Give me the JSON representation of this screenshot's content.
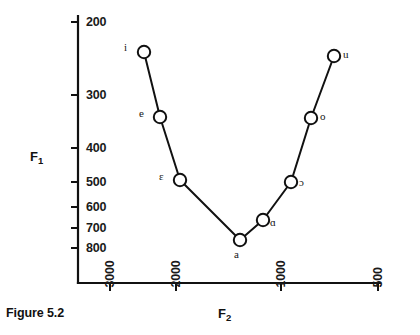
{
  "caption": "Figure 5.2",
  "axes": {
    "y_name": "F",
    "y_name_sub": "1",
    "x_name": "F",
    "x_name_sub": "2",
    "y_ticks": [
      {
        "label": "200",
        "value": 200,
        "y": 22
      },
      {
        "label": "300",
        "value": 300,
        "y": 95
      },
      {
        "label": "400",
        "value": 400,
        "y": 148
      },
      {
        "label": "500",
        "value": 500,
        "y": 182
      },
      {
        "label": "600",
        "value": 600,
        "y": 207
      },
      {
        "label": "700",
        "value": 700,
        "y": 228
      },
      {
        "label": "800",
        "value": 800,
        "y": 248
      }
    ],
    "x_ticks": [
      {
        "label": "3000",
        "value": 3000,
        "x": 110
      },
      {
        "label": "2000",
        "value": 2000,
        "x": 176
      },
      {
        "label": "1000",
        "value": 1000,
        "x": 281
      },
      {
        "label": "500",
        "value": 500,
        "x": 378
      }
    ]
  },
  "chart_data": {
    "type": "line",
    "title": "Figure 5.2",
    "xlabel": "F2",
    "ylabel": "F1",
    "xlim": [
      3400,
      450
    ],
    "ylim": [
      820,
      180
    ],
    "x_axis_reversed": true,
    "y_axis_reversed": true,
    "grid": false,
    "legend": "none",
    "x_tick_labels": [
      "3000",
      "2000",
      "1000",
      "500"
    ],
    "y_tick_labels": [
      "200",
      "300",
      "400",
      "500",
      "600",
      "700",
      "800"
    ],
    "series": [
      {
        "name": "cardinal vowels",
        "point_labels": [
          "i",
          "e",
          "ɛ",
          "a",
          "ɑ",
          "ɔ",
          "o",
          "u"
        ],
        "points": [
          {
            "label": "i",
            "F2": 2350,
            "F1": 245,
            "px": 144,
            "py": 52,
            "label_dx": -17,
            "label_dy": -5
          },
          {
            "label": "e",
            "F2": 2150,
            "F1": 350,
            "px": 160,
            "py": 117,
            "label_dx": -18,
            "label_dy": -4
          },
          {
            "label": "ɛ",
            "F2": 1900,
            "F1": 500,
            "px": 180,
            "py": 180,
            "label_dx": -18,
            "label_dy": -4
          },
          {
            "label": "a",
            "F2": 1300,
            "F1": 715,
            "px": 240,
            "py": 240,
            "label_dx": -3,
            "label_dy": 14
          },
          {
            "label": "ɑ",
            "F2": 1150,
            "F1": 660,
            "px": 263,
            "py": 220,
            "label_dx": 10,
            "label_dy": 2
          },
          {
            "label": "ɔ",
            "F2": 1000,
            "F1": 500,
            "px": 291,
            "py": 182,
            "label_dx": 11,
            "label_dy": 0
          },
          {
            "label": "o",
            "F2": 800,
            "F1": 350,
            "px": 311,
            "py": 118,
            "label_dx": 12,
            "label_dy": -2
          },
          {
            "label": "u",
            "F2": 650,
            "F1": 245,
            "px": 334,
            "py": 56,
            "label_dx": 12,
            "label_dy": -2
          }
        ]
      }
    ]
  },
  "style": {
    "line_color": "#111111",
    "marker_fill": "#ffffff",
    "marker_stroke": "#111111",
    "axis_color": "#111111",
    "background": "#ffffff"
  }
}
